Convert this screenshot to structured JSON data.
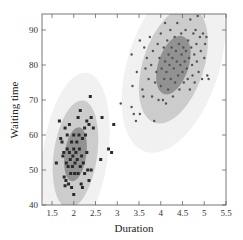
{
  "chart_data": {
    "type": "scatter",
    "title": "",
    "xlabel": "Duration",
    "ylabel": "Waiting time",
    "xlim": [
      1.3,
      5.5
    ],
    "ylim": [
      40,
      96
    ],
    "xticks": [
      1.5,
      2,
      2.5,
      3,
      3.5,
      4,
      4.5,
      5,
      5.5
    ],
    "xtick_labels": [
      "1.5",
      "2",
      "2.5",
      "3",
      "3.5",
      "4",
      "4.5",
      "5",
      "5.5"
    ],
    "yticks": [
      40,
      50,
      60,
      70,
      80,
      90
    ],
    "ytick_labels": [
      "40",
      "50",
      "60",
      "70",
      "80",
      "90"
    ],
    "grid": false,
    "legend": null,
    "annotations": "Gaussian mixture fit: two clusters, each with nested confidence ellipses (inner dark, middle medium, outer light shading)",
    "colors": {
      "outer_ellipse": "#efefef",
      "middle_ellipse": "#c8c8c8",
      "inner_ellipse": "#8c8c8c",
      "cluster1_marker": "#2a2a2a",
      "cluster2_marker": "#555555",
      "axis": "#555555"
    },
    "clusters": [
      {
        "name": "Cluster 1 (short eruptions)",
        "marker": "square",
        "mean": [
          2.04,
          54.5
        ],
        "ellipses": [
          {
            "level": "outer",
            "rx": 0.75,
            "ry": 23.5,
            "angle": 8
          },
          {
            "level": "middle",
            "rx": 0.5,
            "ry": 15.5,
            "angle": 8
          },
          {
            "level": "inner",
            "rx": 0.25,
            "ry": 7.8,
            "angle": 8
          }
        ],
        "points": [
          [
            1.6,
            52
          ],
          [
            1.67,
            64
          ],
          [
            1.7,
            59
          ],
          [
            1.73,
            58
          ],
          [
            1.75,
            54
          ],
          [
            1.77,
            55
          ],
          [
            1.78,
            48
          ],
          [
            1.8,
            62
          ],
          [
            1.8,
            45.5
          ],
          [
            1.82,
            47
          ],
          [
            1.83,
            52
          ],
          [
            1.85,
            60
          ],
          [
            1.85,
            56
          ],
          [
            1.87,
            51
          ],
          [
            1.88,
            46
          ],
          [
            1.9,
            63
          ],
          [
            1.9,
            55
          ],
          [
            1.92,
            53
          ],
          [
            1.93,
            49
          ],
          [
            1.95,
            58
          ],
          [
            1.95,
            45
          ],
          [
            1.97,
            51
          ],
          [
            1.98,
            54
          ],
          [
            2.0,
            60
          ],
          [
            2.0,
            56
          ],
          [
            2.0,
            43
          ],
          [
            2.02,
            49
          ],
          [
            2.03,
            52
          ],
          [
            2.05,
            55
          ],
          [
            2.07,
            58
          ],
          [
            2.08,
            53
          ],
          [
            2.1,
            65
          ],
          [
            2.1,
            49
          ],
          [
            2.12,
            60
          ],
          [
            2.13,
            56
          ],
          [
            2.15,
            67
          ],
          [
            2.15,
            51
          ],
          [
            2.17,
            46
          ],
          [
            2.18,
            54
          ],
          [
            2.2,
            59
          ],
          [
            2.2,
            45
          ],
          [
            2.22,
            52
          ],
          [
            2.25,
            62
          ],
          [
            2.25,
            49
          ],
          [
            2.27,
            60
          ],
          [
            2.3,
            64
          ],
          [
            2.3,
            55
          ],
          [
            2.32,
            50
          ],
          [
            2.35,
            63
          ],
          [
            2.35,
            47
          ],
          [
            2.38,
            71
          ],
          [
            2.4,
            65
          ],
          [
            2.4,
            50
          ],
          [
            2.45,
            62
          ],
          [
            2.62,
            53
          ],
          [
            2.65,
            65
          ],
          [
            2.8,
            56
          ],
          [
            2.87,
            55
          ],
          [
            2.92,
            63
          ]
        ]
      },
      {
        "name": "Cluster 2 (long eruptions)",
        "marker": "circle",
        "mean": [
          4.29,
          79.97
        ],
        "ellipses": [
          {
            "level": "outer",
            "rx": 1.05,
            "ry": 26.0,
            "angle": 18
          },
          {
            "level": "middle",
            "rx": 0.7,
            "ry": 17.3,
            "angle": 18
          },
          {
            "level": "inner",
            "rx": 0.35,
            "ry": 8.7,
            "angle": 18
          }
        ],
        "points": [
          [
            3.08,
            69
          ],
          [
            3.33,
            83
          ],
          [
            3.33,
            68
          ],
          [
            3.35,
            74
          ],
          [
            3.38,
            66
          ],
          [
            3.43,
            64
          ],
          [
            3.45,
            78
          ],
          [
            3.52,
            87
          ],
          [
            3.52,
            66
          ],
          [
            3.58,
            73
          ],
          [
            3.6,
            71
          ],
          [
            3.62,
            85
          ],
          [
            3.65,
            79
          ],
          [
            3.68,
            82
          ],
          [
            3.72,
            76
          ],
          [
            3.75,
            88
          ],
          [
            3.78,
            80
          ],
          [
            3.8,
            71
          ],
          [
            3.82,
            84
          ],
          [
            3.85,
            64
          ],
          [
            3.87,
            75
          ],
          [
            3.9,
            78
          ],
          [
            3.93,
            86
          ],
          [
            3.95,
            70
          ],
          [
            3.97,
            82
          ],
          [
            4.0,
            89
          ],
          [
            4.0,
            74
          ],
          [
            4.02,
            79
          ],
          [
            4.05,
            70
          ],
          [
            4.07,
            85
          ],
          [
            4.08,
            76
          ],
          [
            4.1,
            92
          ],
          [
            4.1,
            81
          ],
          [
            4.12,
            69
          ],
          [
            4.13,
            78
          ],
          [
            4.15,
            87
          ],
          [
            4.17,
            73
          ],
          [
            4.18,
            83
          ],
          [
            4.2,
            80
          ],
          [
            4.22,
            90
          ],
          [
            4.23,
            76
          ],
          [
            4.25,
            85
          ],
          [
            4.27,
            82
          ],
          [
            4.28,
            71
          ],
          [
            4.3,
            79
          ],
          [
            4.32,
            88
          ],
          [
            4.33,
            75
          ],
          [
            4.35,
            84
          ],
          [
            4.37,
            81
          ],
          [
            4.38,
            92
          ],
          [
            4.4,
            77
          ],
          [
            4.42,
            86
          ],
          [
            4.43,
            73
          ],
          [
            4.45,
            80
          ],
          [
            4.47,
            89
          ],
          [
            4.48,
            83
          ],
          [
            4.5,
            78
          ],
          [
            4.52,
            85
          ],
          [
            4.53,
            75
          ],
          [
            4.55,
            81
          ],
          [
            4.57,
            90
          ],
          [
            4.58,
            84
          ],
          [
            4.6,
            79
          ],
          [
            4.62,
            76
          ],
          [
            4.63,
            87
          ],
          [
            4.65,
            82
          ],
          [
            4.67,
            73
          ],
          [
            4.68,
            93
          ],
          [
            4.7,
            85
          ],
          [
            4.72,
            80
          ],
          [
            4.73,
            77
          ],
          [
            4.75,
            89
          ],
          [
            4.77,
            83
          ],
          [
            4.78,
            75
          ],
          [
            4.8,
            90
          ],
          [
            4.82,
            86
          ],
          [
            4.83,
            81
          ],
          [
            4.85,
            94
          ],
          [
            4.87,
            78
          ],
          [
            4.9,
            88
          ],
          [
            4.92,
            84
          ],
          [
            4.95,
            76
          ],
          [
            4.97,
            89
          ],
          [
            5.0,
            82
          ],
          [
            5.02,
            86
          ],
          [
            5.05,
            88
          ],
          [
            5.07,
            77
          ],
          [
            5.1,
            76
          ]
        ]
      }
    ]
  }
}
